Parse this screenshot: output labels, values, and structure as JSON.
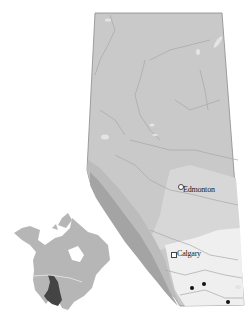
{
  "map": {
    "region": "Alberta",
    "colors": {
      "background": "#ffffff",
      "boreal": "#c8c8c8",
      "parkland": "#d6d6d6",
      "grassland": "#efefef",
      "mountains": "#a9a9a9",
      "foothills": "#bdbdbd",
      "rivers": "#b0b0b0",
      "lakes": "#e4e4e4",
      "range_highlight": "#444444",
      "inset_land": "#b5b5b5"
    },
    "cities": [
      {
        "name": "Edmonton",
        "marker": "circle"
      },
      {
        "name": "Calgary",
        "marker": "square"
      }
    ],
    "points": [
      {
        "id": 1
      },
      {
        "id": 2
      },
      {
        "id": 3
      }
    ],
    "inset": {
      "title": "North America",
      "highlight": "species range"
    }
  }
}
